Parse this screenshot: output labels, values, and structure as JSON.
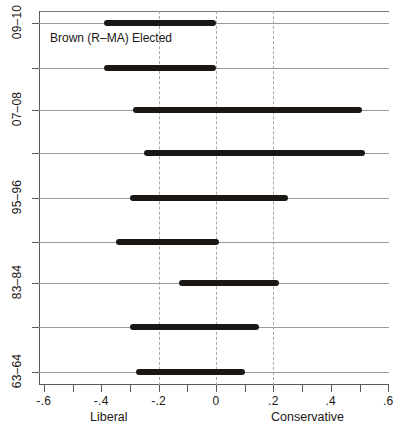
{
  "chart_data": {
    "type": "bar",
    "orientation": "horizontal",
    "title": "",
    "xlabel": "",
    "ylabel": "",
    "xlim": [
      -0.7,
      0.66
    ],
    "grid": true,
    "legend": null,
    "x_ticks": [
      -0.6,
      -0.5,
      -0.4,
      -0.3,
      -0.2,
      -0.1,
      0,
      0.1,
      0.2,
      0.3,
      0.4,
      0.5,
      0.6
    ],
    "x_tick_labels": [
      "-.6",
      "",
      "-.4",
      "",
      "-.2",
      "",
      "0",
      "",
      ".2",
      "",
      ".4",
      "",
      ".6"
    ],
    "x_dashed_reference_lines": [
      -0.2,
      0,
      0.2
    ],
    "pole_label_left": "Liberal",
    "pole_label_right": "Conservative",
    "annotations": [
      {
        "text": "Brown (R–MA) Elected",
        "x": -0.31,
        "y_index": 0
      }
    ],
    "y_categories": [
      "09–10",
      "",
      "07–08",
      "",
      "95–96",
      "",
      "83–84",
      "",
      "63–64"
    ],
    "y_tick_labels_visible": [
      "09–10",
      "07–08",
      "95–96",
      "83–84",
      "63–64"
    ],
    "ranges": [
      {
        "category": "09–10",
        "low": -0.39,
        "high": 0.0
      },
      {
        "category": "",
        "low": -0.39,
        "high": 0.0
      },
      {
        "category": "07–08",
        "low": -0.29,
        "high": 0.51
      },
      {
        "category": "",
        "low": -0.25,
        "high": 0.52
      },
      {
        "category": "95–96",
        "low": -0.3,
        "high": 0.25
      },
      {
        "category": "",
        "low": -0.35,
        "high": 0.01
      },
      {
        "category": "83–84",
        "low": -0.13,
        "high": 0.22
      },
      {
        "category": "",
        "low": -0.3,
        "high": 0.15
      },
      {
        "category": "63–64",
        "low": -0.28,
        "high": 0.1
      }
    ],
    "bar_color": "#1a1714",
    "grid_color": "#9b9b96",
    "dash_color": "#a9a9a4",
    "background_color": "#ffffff"
  },
  "geometry": {
    "x_zero_px": 216,
    "px_per_unit": 287,
    "row_y_px": [
      23,
      68,
      110,
      153,
      198,
      242,
      283,
      327,
      372
    ],
    "y_tick_y_px": [
      23,
      68,
      110,
      153,
      198,
      242,
      283,
      327,
      372
    ],
    "y_label_y_px": [
      23,
      110,
      198,
      283,
      372
    ]
  }
}
